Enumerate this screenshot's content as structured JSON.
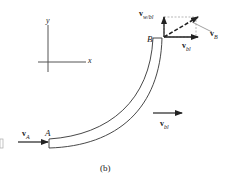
{
  "figure": {
    "caption": "(b)",
    "axes": {
      "x_label": "x",
      "y_label": "y"
    },
    "points": {
      "A": "A",
      "B": "B"
    },
    "vectors": {
      "vA": {
        "main": "v",
        "sub": "A"
      },
      "vB": {
        "main": "v",
        "sub": "B"
      },
      "vbl_top": {
        "main": "v",
        "sub": "bl"
      },
      "vbl_right": {
        "main": "v",
        "sub": "bl"
      },
      "vwbl": {
        "main": "v",
        "sub": "w/bl"
      }
    },
    "colors": {
      "stroke": "#222222",
      "dashed": "#999999"
    }
  }
}
